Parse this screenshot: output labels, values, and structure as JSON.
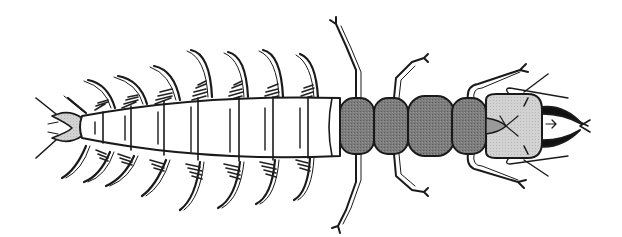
{
  "figure": {
    "subject": "Aquatic insect larva (hellgrammite-type), dorsal view",
    "orientation": "head pointing right",
    "colors": {
      "background": "#ffffff",
      "outline": "#1a1a1a",
      "abdomen_fill": "#ffffff",
      "thorax_fill": "#7a7a7a",
      "head_fill": "#cfcfcf",
      "tail_fill": "#d8d8d8",
      "gill_tufts": "#222222"
    },
    "parts": {
      "head": "head-capsule",
      "mandibles": "mandibles",
      "thorax_segments": 4,
      "abdomen_segments": 8,
      "lateral_filaments_per_side": 9,
      "legs_per_side": 3,
      "tail": "anal-prolegs"
    }
  }
}
